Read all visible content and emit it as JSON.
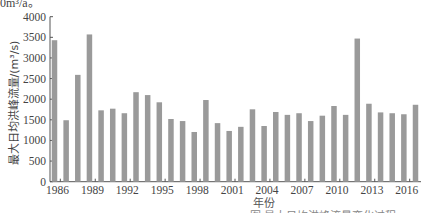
{
  "top_partial_text": "0m³/a。",
  "chart_data": {
    "type": "bar",
    "title": "",
    "xlabel": "年份",
    "ylabel": "最大日均洪峰流量/(m³/s)",
    "ylim": [
      0,
      4000
    ],
    "yticks": [
      0,
      500,
      1000,
      1500,
      2000,
      2500,
      3000,
      3500,
      4000
    ],
    "xtick_labels": [
      "1986",
      "1989",
      "1992",
      "1995",
      "1998",
      "2001",
      "2004",
      "2007",
      "2010",
      "2013",
      "2016"
    ],
    "grid": false,
    "legend": null,
    "bar_color": "#9a9a9a",
    "categories": [
      "1986",
      "1987",
      "1988",
      "1989",
      "1990",
      "1991",
      "1992",
      "1993",
      "1994",
      "1995",
      "1996",
      "1997",
      "1998",
      "1999",
      "2000",
      "2001",
      "2002",
      "2003",
      "2004",
      "2005",
      "2006",
      "2007",
      "2008",
      "2009",
      "2010",
      "2011",
      "2012",
      "2013",
      "2014",
      "2015",
      "2016",
      "2017"
    ],
    "values": [
      3430,
      1490,
      2590,
      3570,
      1730,
      1770,
      1660,
      2170,
      2100,
      1925,
      1520,
      1470,
      1205,
      1980,
      1420,
      1230,
      1330,
      1755,
      1350,
      1690,
      1620,
      1660,
      1470,
      1600,
      1835,
      1620,
      3470,
      1890,
      1680,
      1660,
      1635,
      1865
    ]
  },
  "caption_partial": "图 最大日均洪峰流量变化过程"
}
